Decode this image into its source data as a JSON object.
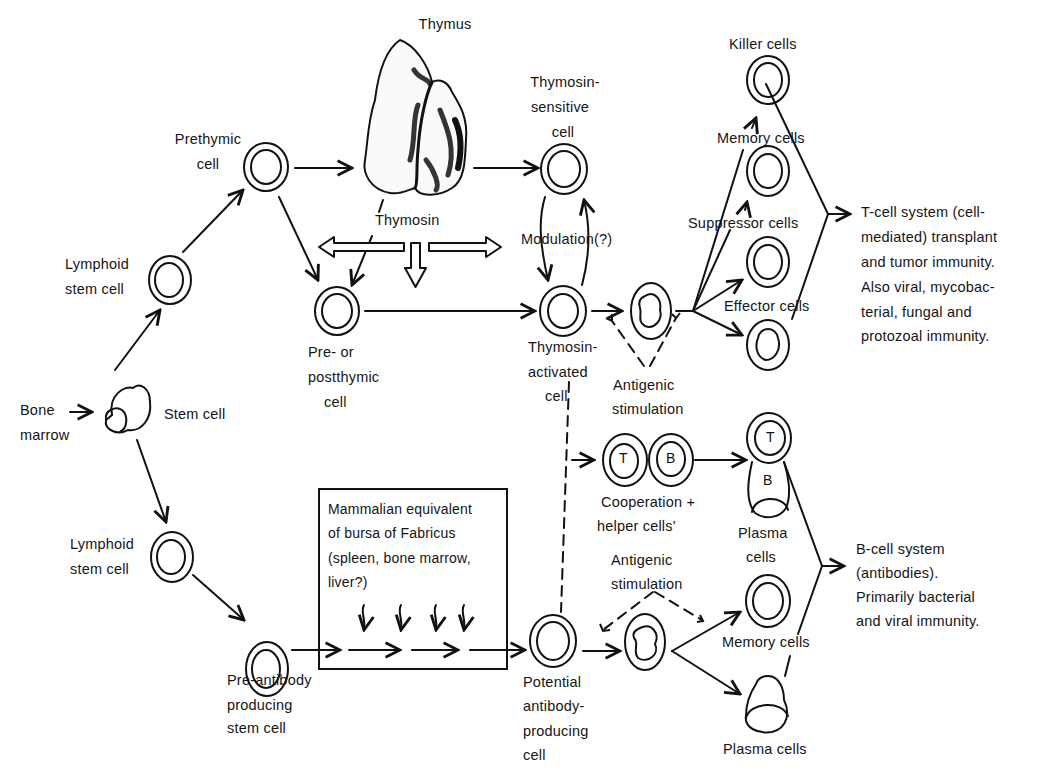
{
  "diagram": {
    "title_implied": "Lymphocyte development: T-cell and B-cell systems",
    "labels": {
      "thymus": "Thymus",
      "thymosin": "Thymosin",
      "prethymic_1": "Prethymic",
      "prethymic_2": "cell",
      "lymphoid_top_1": "Lymphoid",
      "lymphoid_top_2": "stem cell",
      "bone_marrow_1": "Bone",
      "bone_marrow_2": "marrow",
      "stem_cell": "Stem cell",
      "pre_post_1": "Pre- or",
      "pre_post_2": "postthymic",
      "pre_post_3": "cell",
      "thymosin_sensitive_1": "Thymosin-",
      "thymosin_sensitive_2": "sensitive",
      "thymosin_sensitive_3": "cell",
      "modulation": "Modulation(?)",
      "thymosin_activated_1": "Thymosin-",
      "thymosin_activated_2": "activated",
      "thymosin_activated_3": "cell",
      "antigenic_top_1": "Antigenic",
      "antigenic_top_2": "stimulation",
      "killer_cells": "Killer cells",
      "memory_cells_t": "Memory cells",
      "suppressor_cells": "Suppressor cells",
      "effector_cells": "Effector cells",
      "t_system_1": "T-cell system (cell-",
      "t_system_2": "mediated) transplant",
      "t_system_3": "and tumor immunity.",
      "t_system_4": "Also viral, mycobac-",
      "t_system_5": "terial, fungal and",
      "t_system_6": "protozoal immunity.",
      "cooperation_1": "Cooperation +",
      "cooperation_2": "helper cells'",
      "t_mark": "T",
      "b_mark": "B",
      "t_mark_2": "T",
      "b_mark_2": "B",
      "plasma_top_1": "Plasma",
      "plasma_top_2": "cells",
      "lymphoid_bottom_1": "Lymphoid",
      "lymphoid_bottom_2": "stem cell",
      "bursa_1": "Mammalian equivalent",
      "bursa_2": "of bursa of Fabricus",
      "bursa_3": "(spleen, bone marrow,",
      "bursa_4": "liver?)",
      "antigenic_bottom_1": "Antigenic",
      "antigenic_bottom_2": "stimulation",
      "b_system_1": "B-cell system",
      "b_system_2": "(antibodies).",
      "b_system_3": "Primarily bacterial",
      "b_system_4": "and viral immunity.",
      "memory_cells_b": "Memory cells",
      "pre_antibody_1": "Pre-antibody",
      "pre_antibody_2": "producing",
      "pre_antibody_3": "stem cell",
      "potential_1": "Potential",
      "potential_2": "antibody-",
      "potential_3": "producing",
      "potential_4": "cell",
      "plasma_bottom": "Plasma cells"
    },
    "colors": {
      "ink": "#111111",
      "background": "#ffffff"
    }
  }
}
